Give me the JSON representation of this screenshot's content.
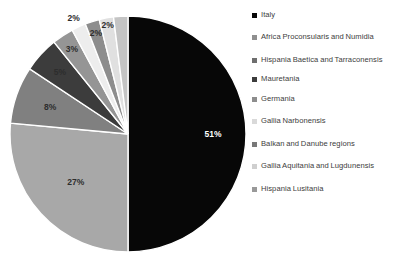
{
  "chart_data": {
    "type": "pie",
    "title": "",
    "categories": [
      "Italy",
      "Africa Proconsularis and Numidia",
      "Hispania Baetica and Tarraconensis",
      "Mauretania",
      "Germania",
      "Gallia Narbonensis",
      "Balkan and Danube regions",
      "Gallia Aquitania and Lugdunensis",
      "Hispania Lusitania"
    ],
    "values": [
      51,
      27,
      8,
      5,
      3,
      2,
      2,
      2,
      2
    ],
    "data_labels": [
      "51%",
      "27%",
      "8%",
      "5%",
      "3%",
      "2%",
      "2%",
      "2%",
      "2%"
    ],
    "colors": [
      "#070707",
      "#a8a8a8",
      "#808080",
      "#3c3c3c",
      "#959595",
      "#ededed",
      "#8d8d8d",
      "#e0e0e0",
      "#c4c4c4"
    ],
    "start_angle_deg": 0,
    "direction": "clockwise",
    "legend_position": "right",
    "grid": false,
    "xlabel": "",
    "ylabel": ""
  },
  "legend": {
    "items": [
      {
        "label": "Italy",
        "color": "#070707"
      },
      {
        "label": "Africa Proconsularis and Numidia",
        "color": "#8f8f8f"
      },
      {
        "label": "Hispania Baetica and Tarraconensis",
        "color": "#6e6e6e"
      },
      {
        "label": "Mauretania",
        "color": "#3c3c3c"
      },
      {
        "label": "Germania",
        "color": "#8d8d8d"
      },
      {
        "label": "Gallia Narbonensis",
        "color": "#d9d9d9"
      },
      {
        "label": "Balkan and Danube regions",
        "color": "#787878"
      },
      {
        "label": "Gallia Aquitania and Lugdunensis",
        "color": "#cfcfcf"
      },
      {
        "label": "Hispania Lusitania",
        "color": "#999999"
      }
    ]
  }
}
